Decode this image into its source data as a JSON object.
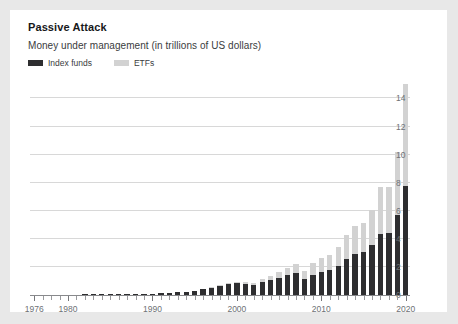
{
  "card": {
    "title": "Passive Attack",
    "subtitle": "Money under management (in trillions of US dollars)"
  },
  "legend": {
    "position": "top-left",
    "items": [
      {
        "label": "Index funds",
        "color": "#2e2e30",
        "swatch": "legend-swatch-index-funds"
      },
      {
        "label": "ETFs",
        "color": "#d2d2d2",
        "swatch": "legend-swatch-etfs"
      }
    ]
  },
  "colors": {
    "index_funds": "#2e2e30",
    "etfs": "#d2d2d2",
    "gridline": "#d8d8d8",
    "axis": "#88898c",
    "tick_text": "#6e7175",
    "card_background": "#ffffff",
    "page_background": "#e8e8e8"
  },
  "chart_data": {
    "type": "bar",
    "stacked": true,
    "title": "Passive Attack",
    "subtitle": "Money under management (in trillions of US dollars)",
    "xlabel": "",
    "ylabel": "",
    "ylim": [
      0,
      15.6
    ],
    "yticks": [
      0,
      2,
      4,
      6,
      8,
      10,
      12,
      14
    ],
    "ytick_labels": [
      "0",
      "2",
      "4",
      "6",
      "8",
      "10",
      "12",
      "14"
    ],
    "y_axis_position": "right",
    "grid": true,
    "grid_axis": "y",
    "xlim": [
      1976,
      2020
    ],
    "xticks_major": [
      1976,
      1980,
      1990,
      2000,
      2010,
      2020
    ],
    "xtick_labels": [
      "1976",
      "1980",
      "1990",
      "2000",
      "2010",
      "2020"
    ],
    "xticks_minor_interval": 1,
    "categories": [
      1976,
      1977,
      1978,
      1979,
      1980,
      1981,
      1982,
      1983,
      1984,
      1985,
      1986,
      1987,
      1988,
      1989,
      1990,
      1991,
      1992,
      1993,
      1994,
      1995,
      1996,
      1997,
      1998,
      1999,
      2000,
      2001,
      2002,
      2003,
      2004,
      2005,
      2006,
      2007,
      2008,
      2009,
      2010,
      2011,
      2012,
      2013,
      2014,
      2015,
      2016,
      2017,
      2018,
      2019,
      2020
    ],
    "series": [
      {
        "name": "Index funds",
        "color": "#2e2e30",
        "values": [
          0.0,
          0.0,
          0.0,
          0.0,
          0.01,
          0.01,
          0.02,
          0.02,
          0.03,
          0.04,
          0.05,
          0.06,
          0.07,
          0.09,
          0.1,
          0.13,
          0.16,
          0.2,
          0.24,
          0.31,
          0.4,
          0.52,
          0.65,
          0.8,
          0.85,
          0.8,
          0.72,
          0.92,
          1.08,
          1.22,
          1.4,
          1.55,
          1.15,
          1.45,
          1.65,
          1.75,
          2.05,
          2.55,
          2.9,
          3.05,
          3.55,
          4.35,
          4.45,
          5.7,
          7.8
        ]
      },
      {
        "name": "ETFs",
        "color": "#d2d2d2",
        "values": [
          0.0,
          0.0,
          0.0,
          0.0,
          0.0,
          0.0,
          0.0,
          0.0,
          0.0,
          0.0,
          0.0,
          0.0,
          0.0,
          0.0,
          0.0,
          0.0,
          0.0,
          0.0,
          0.01,
          0.01,
          0.02,
          0.03,
          0.05,
          0.08,
          0.1,
          0.12,
          0.14,
          0.22,
          0.3,
          0.4,
          0.55,
          0.65,
          0.55,
          0.8,
          1.0,
          1.1,
          1.35,
          1.7,
          2.0,
          2.1,
          2.5,
          3.35,
          3.25,
          4.5,
          7.2
        ]
      }
    ],
    "totals": [
      0.0,
      0.0,
      0.0,
      0.0,
      0.01,
      0.01,
      0.02,
      0.02,
      0.03,
      0.04,
      0.05,
      0.06,
      0.07,
      0.09,
      0.1,
      0.13,
      0.16,
      0.2,
      0.25,
      0.32,
      0.42,
      0.55,
      0.7,
      0.88,
      0.95,
      0.92,
      0.86,
      1.14,
      1.38,
      1.62,
      1.95,
      2.2,
      1.7,
      2.25,
      2.65,
      2.85,
      3.4,
      4.25,
      4.9,
      5.15,
      6.05,
      7.7,
      7.7,
      10.2,
      15.0
    ]
  }
}
